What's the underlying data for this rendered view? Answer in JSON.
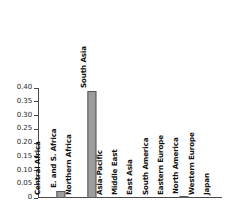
{
  "chart_data": {
    "type": "bar",
    "title": "",
    "subtitle": "",
    "xlabel": "",
    "ylabel": "",
    "ylim": [
      0,
      0.4
    ],
    "grid": false,
    "legend": "none",
    "orientation": "vertical",
    "bar_color": "#9d9d9d",
    "bar_edge_color": "#595959",
    "axis_color": "#4a4a4a",
    "label_rotation": 90,
    "categories": [
      "Central Africa",
      "E. and S. Africa",
      "Northern Africa",
      "South Asia",
      "Asia-Pacific",
      "Middle East",
      "East Asia",
      "South America",
      "Eastern Europe",
      "North America",
      "Western Europe",
      "Japan"
    ],
    "values": [
      0.0,
      0.025,
      0.0,
      0.39,
      0.0,
      0.0,
      0.0,
      0.0,
      0.0,
      0.004,
      0.0,
      0.0
    ],
    "ytick_labels": [
      "0",
      "0.05",
      "0.10",
      "0.15",
      "0.20",
      "0.25",
      "0.30",
      "0.35",
      "0.40"
    ],
    "ytick_values": [
      0,
      0.05,
      0.1,
      0.15,
      0.2,
      0.25,
      0.3,
      0.35,
      0.4
    ]
  }
}
